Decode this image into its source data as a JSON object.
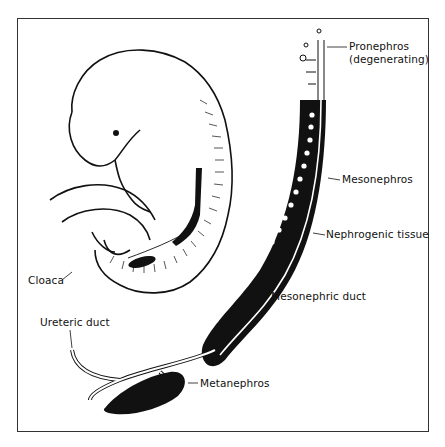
{
  "figure": {
    "labels": {
      "pronephros_line1": "Pronephros",
      "pronephros_line2": "(degenerating)",
      "mesonephros": "Mesonephros",
      "nephrogenic_tissue": "Nephrogenic tissue",
      "mesonephric_duct": "Mesonephric duct",
      "cloaca": "Cloaca",
      "ureteric_duct": "Ureteric duct",
      "metanephros": "Metanephros"
    },
    "colors": {
      "ink": "#111111",
      "background": "#ffffff",
      "frame": "#333333"
    }
  }
}
